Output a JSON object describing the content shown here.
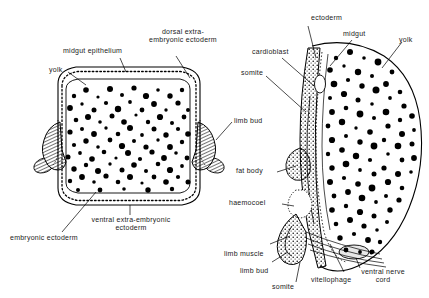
{
  "figure": {
    "background_color": "#ffffff",
    "ink_color": "#000000",
    "panels": [
      {
        "id": "left",
        "name": "whole transverse section"
      },
      {
        "id": "right",
        "name": "half section detail"
      }
    ]
  },
  "labels": {
    "left": [
      {
        "key": "midgut_epithelium",
        "text": "midgut epithelium"
      },
      {
        "key": "dorsal_extra_embryonic_ectoderm",
        "line1": "dorsal extra-",
        "line2": "embryonic ectoderm"
      },
      {
        "key": "yolk",
        "text": "yolk"
      },
      {
        "key": "limb_bud",
        "text": "limb bud"
      },
      {
        "key": "ventral_extra_embryonic_ectoderm",
        "line1": "ventral extra-embryonic",
        "line2": "ectoderm"
      },
      {
        "key": "embryonic_ectoderm",
        "text": "embryonic ectoderm"
      }
    ],
    "right": [
      {
        "key": "ectoderm",
        "text": "ectoderm"
      },
      {
        "key": "midgut",
        "text": "midgut"
      },
      {
        "key": "yolk",
        "text": "yolk"
      },
      {
        "key": "cardioblast",
        "text": "cardioblast"
      },
      {
        "key": "somite_upper",
        "text": "somite"
      },
      {
        "key": "fat_body",
        "text": "fat body"
      },
      {
        "key": "haemocoel",
        "text": "haemocoel"
      },
      {
        "key": "limb_muscle",
        "text": "limb muscle"
      },
      {
        "key": "limb_bud",
        "text": "limb bud"
      },
      {
        "key": "somite_lower",
        "text": "somite"
      },
      {
        "key": "vitellophage",
        "text": "vitellophage"
      },
      {
        "key": "ventral_nerve_cord",
        "line1": "ventral nerve",
        "line2": "cord"
      }
    ]
  }
}
